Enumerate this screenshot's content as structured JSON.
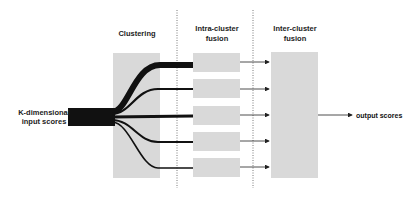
{
  "diagram": {
    "stages": [
      {
        "id": "clustering",
        "title_lines": [
          "Clustering"
        ]
      },
      {
        "id": "intra",
        "title_lines": [
          "Intra-cluster",
          "fusion"
        ]
      },
      {
        "id": "inter",
        "title_lines": [
          "Inter-cluster",
          "fusion"
        ]
      }
    ],
    "input_label_lines": [
      "K-dimensional",
      "input scores"
    ],
    "output_label": "output scores",
    "cluster_count": 5,
    "colors": {
      "box_fill": "#d9d9d9",
      "flow": "#111111",
      "arrow": "#333333",
      "divider": "#555555"
    }
  }
}
